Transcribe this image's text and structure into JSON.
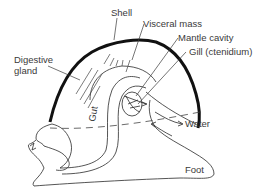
{
  "figure": {
    "labels": {
      "shell": "Shell",
      "visceral_mass": "Visceral mass",
      "mantle_cavity": "Mantle cavity",
      "gill": "Gill (ctenidium)",
      "digestive_gland_line1": "Digestive",
      "digestive_gland_line2": "gland",
      "gut": "Gut",
      "water": "Water",
      "foot": "Foot"
    },
    "colors": {
      "shell_stroke": "#111111",
      "line": "#2a2a2a",
      "text": "#3a3a3a",
      "background": "#ffffff"
    }
  }
}
